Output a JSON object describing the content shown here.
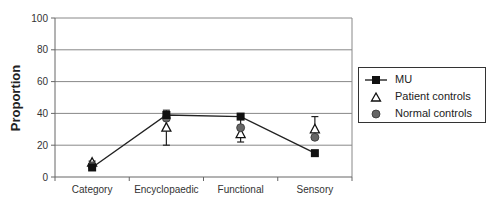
{
  "chart_data": {
    "type": "line",
    "title": "",
    "xlabel": "",
    "ylabel": "Proportion",
    "ylim": [
      0,
      100
    ],
    "yticks": [
      0,
      20,
      40,
      60,
      80,
      100
    ],
    "grid": true,
    "legend_position": "right",
    "categories": [
      "Category",
      "Encyclopaedic",
      "Functional",
      "Sensory"
    ],
    "series": [
      {
        "name": "MU",
        "marker": "square-filled",
        "line": true,
        "values": [
          6,
          39,
          38,
          15
        ]
      },
      {
        "name": "Patient controls",
        "marker": "triangle-open",
        "line": false,
        "values": [
          9,
          31,
          27,
          30
        ],
        "error_bars": [
          [
            8,
            10
          ],
          [
            20,
            42
          ],
          [
            22,
            37
          ],
          [
            24,
            38
          ]
        ]
      },
      {
        "name": "Normal controls",
        "marker": "circle-filled-gray",
        "line": false,
        "values": [
          7,
          37,
          31,
          25
        ]
      }
    ]
  },
  "legend": {
    "items": [
      {
        "label": "MU"
      },
      {
        "label": "Patient controls"
      },
      {
        "label": "Normal controls"
      }
    ]
  },
  "axis": {
    "ylabel": "Proportion",
    "yticks": [
      "0",
      "20",
      "40",
      "60",
      "80",
      "100"
    ],
    "xticks": [
      "Category",
      "Encyclopaedic",
      "Functional",
      "Sensory"
    ]
  }
}
